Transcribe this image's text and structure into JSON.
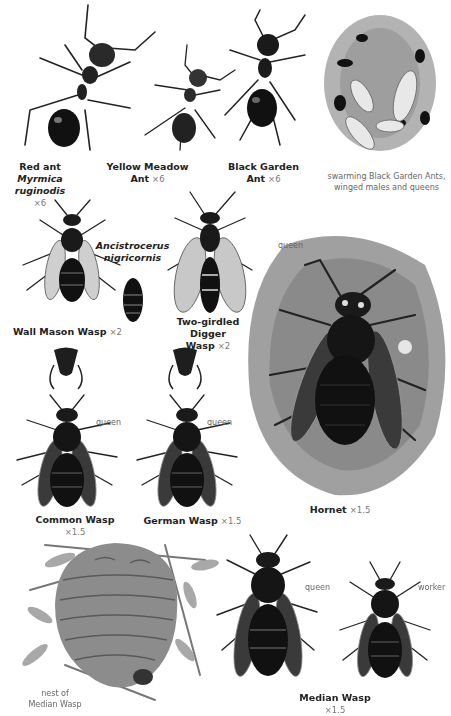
{
  "page": {
    "theme": "grayscale field guide illustrations",
    "colors": {
      "ink": "#111111",
      "body": "#1c1c1c",
      "wing": "#bdbdbd",
      "ground": "#8a8a8a",
      "caption": "#222222",
      "note": "#666666"
    }
  },
  "specimens": [
    {
      "id": "red-ant",
      "common": "Red ant",
      "scientific": "Myrmica ruginodis",
      "scale": "×6"
    },
    {
      "id": "yellow-meadow-ant",
      "common_l1": "Yellow Meadow",
      "common_l2": "Ant",
      "scale": "×6"
    },
    {
      "id": "black-garden-ant",
      "common_l1": "Black Garden",
      "common_l2": "Ant",
      "scale": "×6"
    },
    {
      "id": "swarming",
      "note_l1": "swarming Black Garden Ants,",
      "note_l2": "winged males and queens"
    },
    {
      "id": "wall-mason-wasp",
      "common": "Wall Mason Wasp",
      "scale": "×2"
    },
    {
      "id": "ancistrocerus",
      "scientific_l1": "Ancistrocerus",
      "scientific_l2": "nigricornis"
    },
    {
      "id": "two-girdled-digger-wasp",
      "common_l1": "Two-girdled Digger",
      "common_l2": "Wasp",
      "scale": "×2"
    },
    {
      "id": "hornet",
      "common": "Hornet",
      "scale": "×1.5",
      "tag": "queen"
    },
    {
      "id": "common-wasp",
      "common": "Common Wasp",
      "scale": "×1.5",
      "tag": "queen"
    },
    {
      "id": "german-wasp",
      "common": "German Wasp",
      "scale": "×1.5",
      "tag": "queen"
    },
    {
      "id": "median-wasp-nest",
      "note_l1": "nest of",
      "note_l2": "Median Wasp"
    },
    {
      "id": "median-wasp",
      "common": "Median Wasp",
      "scale": "×1.5",
      "tag_queen": "queen",
      "tag_worker": "worker"
    }
  ]
}
